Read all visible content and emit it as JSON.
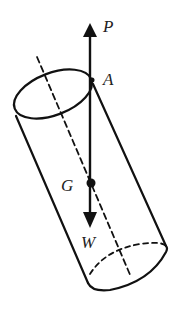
{
  "diagram": {
    "type": "physics-free-body",
    "labels": {
      "force_up": "P",
      "point_top": "A",
      "center_of_gravity": "G",
      "weight": "W"
    },
    "colors": {
      "stroke": "#111111",
      "background": "#ffffff"
    }
  }
}
